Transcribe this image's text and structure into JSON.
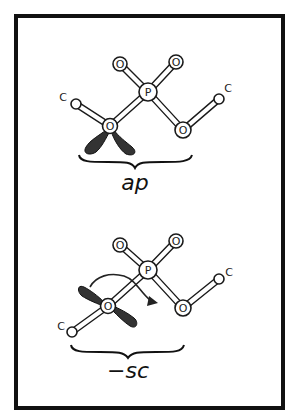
{
  "figure": {
    "frame": {
      "x": 16,
      "y": 16,
      "width": 268,
      "height": 392,
      "stroke": "#111111",
      "stroke_width": 4
    }
  },
  "colors": {
    "bond_stroke": "#1a1a1a",
    "atom_fill": "#ffffff",
    "lone_pair_fill": "#333333",
    "text": "#111111"
  },
  "top_conformer": {
    "label": "ap",
    "atoms": {
      "c_left": {
        "label": "C",
        "x": 76,
        "y": 104
      },
      "o_ester": {
        "label": "O",
        "x": 110,
        "y": 126
      },
      "p": {
        "label": "P",
        "x": 148,
        "y": 92
      },
      "o_upper_left": {
        "label": "O",
        "x": 120,
        "y": 64
      },
      "o_upper_right": {
        "label": "O",
        "x": 176,
        "y": 62
      },
      "o_right": {
        "label": "O",
        "x": 183,
        "y": 130
      },
      "c_right": {
        "label": "C",
        "x": 219,
        "y": 99
      }
    }
  },
  "bottom_conformer": {
    "label": "−sc",
    "atoms": {
      "c_left": {
        "label": "C",
        "x": 72,
        "y": 332
      },
      "o_ester": {
        "label": "O",
        "x": 108,
        "y": 306
      },
      "p": {
        "label": "P",
        "x": 148,
        "y": 270
      },
      "o_upper_left": {
        "label": "O",
        "x": 120,
        "y": 245
      },
      "o_upper_right": {
        "label": "O",
        "x": 176,
        "y": 241
      },
      "o_right": {
        "label": "O",
        "x": 183,
        "y": 308
      },
      "c_right": {
        "label": "C",
        "x": 219,
        "y": 279
      }
    },
    "rotation_arrow": {
      "direction": "clockwise"
    }
  }
}
